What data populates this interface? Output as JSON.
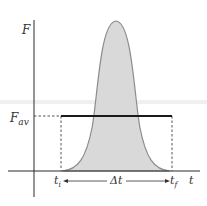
{
  "figure": {
    "type": "force-time impulse graph",
    "y_axis_label": "F",
    "x_axis_label": "t",
    "avg_force_label_main": "F",
    "avg_force_label_sub": "av",
    "t_initial_main": "t",
    "t_initial_sub": "i",
    "t_final_main": "t",
    "t_final_sub": "f",
    "interval_label": "Δt"
  },
  "colors": {
    "axis": "#2a2a2a",
    "curve_fill": "#d9d9d9",
    "curve_stroke": "#8c8c8c",
    "avg_line": "#1a1a1a",
    "dashed": "#444444",
    "band": "#f0f0f0"
  }
}
